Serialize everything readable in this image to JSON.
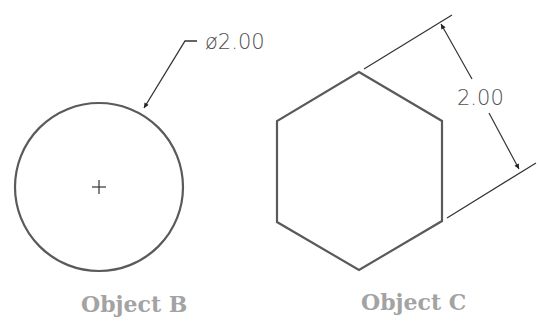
{
  "objects": [
    {
      "name": "Object B",
      "shape": "circle",
      "dimension": "ø2.00",
      "dimension_type": "diameter"
    },
    {
      "name": "Object C",
      "shape": "hexagon",
      "dimension": "2.00",
      "dimension_type": "across-flats"
    }
  ],
  "colors": {
    "geometry": "#5a5a5a",
    "dimension_lines": "#333333",
    "label": "#a3a3a3"
  }
}
